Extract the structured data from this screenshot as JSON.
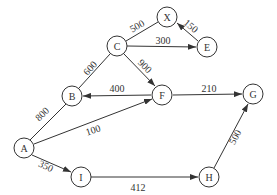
{
  "diagram": {
    "type": "weighted-directed-graph",
    "nodes": [
      {
        "id": "X",
        "label": "X"
      },
      {
        "id": "C",
        "label": "C"
      },
      {
        "id": "E",
        "label": "E"
      },
      {
        "id": "B",
        "label": "B"
      },
      {
        "id": "F",
        "label": "F"
      },
      {
        "id": "G",
        "label": "G"
      },
      {
        "id": "A",
        "label": "A"
      },
      {
        "id": "I",
        "label": "I"
      },
      {
        "id": "H",
        "label": "H"
      }
    ],
    "edges": [
      {
        "from": "C",
        "to": "X",
        "weight": "500",
        "directed": false
      },
      {
        "from": "E",
        "to": "X",
        "weight": "150",
        "directed": true
      },
      {
        "from": "C",
        "to": "E",
        "weight": "300",
        "directed": true
      },
      {
        "from": "B",
        "to": "C",
        "weight": "600",
        "directed": false
      },
      {
        "from": "C",
        "to": "F",
        "weight": "900",
        "directed": true
      },
      {
        "from": "F",
        "to": "B",
        "weight": "400",
        "directed": true
      },
      {
        "from": "F",
        "to": "G",
        "weight": "210",
        "directed": true
      },
      {
        "from": "A",
        "to": "B",
        "weight": "800",
        "directed": false
      },
      {
        "from": "A",
        "to": "F",
        "weight": "100",
        "directed": true
      },
      {
        "from": "A",
        "to": "I",
        "weight": "350",
        "directed": true
      },
      {
        "from": "I",
        "to": "H",
        "weight": "412",
        "directed": true
      },
      {
        "from": "H",
        "to": "G",
        "weight": "500",
        "directed": true
      }
    ]
  }
}
